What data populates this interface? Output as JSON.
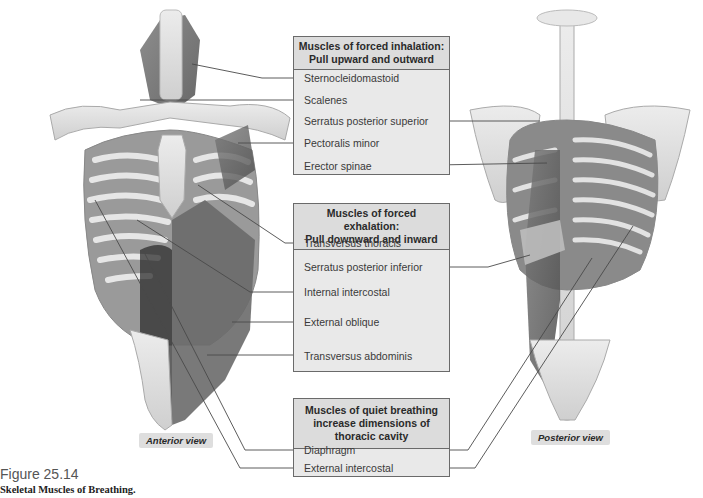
{
  "figure": {
    "number": "Figure 25.14",
    "caption": "Skeletal Muscles of Breathing."
  },
  "views": {
    "anterior": "Anterior view",
    "posterior": "Posterior view"
  },
  "groups": [
    {
      "title_lines": [
        "Muscles of forced inhalation:",
        "Pull upward and outward"
      ],
      "items": [
        "Sternocleidomastoid",
        "Scalenes",
        "Serratus posterior superior",
        "Pectoralis minor",
        "Erector spinae"
      ]
    },
    {
      "title_lines": [
        "Muscles of forced exhalation:",
        "Pull downward and inward"
      ],
      "items": [
        "Transversus thoracis",
        "Serratus posterior inferior",
        "Internal intercostal",
        "External oblique",
        "Transversus abdominis"
      ]
    },
    {
      "title_lines": [
        "Muscles of quiet breathing",
        "increase dimensions of",
        "thoracic cavity"
      ],
      "items": [
        "Diaphragm",
        "External intercostal"
      ]
    }
  ],
  "colors": {
    "box_fill": "#e9e9e9",
    "box_header": "#dcdcdc",
    "box_border": "#6a6a6a",
    "leader_line": "#4a4a4a"
  }
}
